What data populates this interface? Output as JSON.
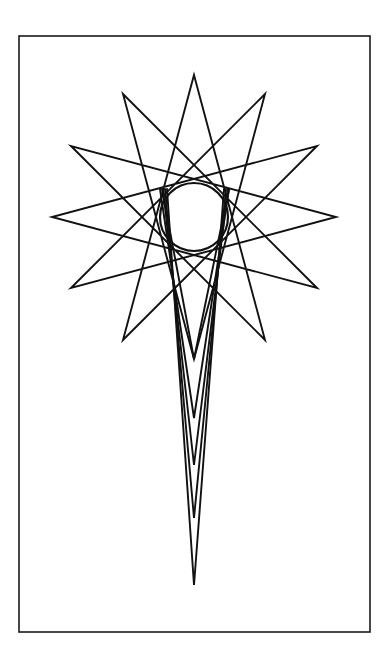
{
  "page": {
    "background_color": "#ffffff",
    "width": 388,
    "height": 663
  },
  "frame": {
    "name": "rectangular-border",
    "x": 19,
    "y": 36,
    "width": 351,
    "height": 596,
    "stroke_color": "#1a1a1a",
    "stroke_width": 1.6,
    "fill": "none"
  },
  "figure": {
    "name": "star-comet-figure",
    "stroke_color": "#111111",
    "stroke_width": 1.9,
    "fill": "none",
    "center_x": 194,
    "center_y": 217
  },
  "star": {
    "name": "twelve-point-star-polygon",
    "points": 12,
    "step": 5,
    "outer_radius": 142,
    "start_angle_deg": -90,
    "vertices": [
      {
        "index": 0,
        "x": 194,
        "y": 75
      },
      {
        "index": 1,
        "x": 265,
        "y": 94
      },
      {
        "index": 2,
        "x": 317,
        "y": 146
      },
      {
        "index": 3,
        "x": 336,
        "y": 217
      },
      {
        "index": 4,
        "x": 317,
        "y": 288
      },
      {
        "index": 5,
        "x": 265,
        "y": 340
      },
      {
        "index": 6,
        "x": 194,
        "y": 359
      },
      {
        "index": 7,
        "x": 123,
        "y": 340
      },
      {
        "index": 8,
        "x": 71,
        "y": 288
      },
      {
        "index": 9,
        "x": 52,
        "y": 217
      },
      {
        "index": 10,
        "x": 71,
        "y": 146
      },
      {
        "index": 11,
        "x": 123,
        "y": 94
      }
    ]
  },
  "inner_circle": {
    "name": "central-envelope-circle",
    "center_x": 194,
    "center_y": 217,
    "radius": 34,
    "stroke_color": "#111111",
    "stroke_width": 2.2,
    "fill": "none"
  },
  "tail": {
    "name": "comet-tail-lines",
    "apex_x": 194,
    "tip_count": 5,
    "tips": [
      {
        "index": 0,
        "x": 194,
        "y": 359,
        "left_x": 162,
        "right_x": 229
      },
      {
        "index": 1,
        "x": 194,
        "y": 418,
        "left_x": 160,
        "right_x": 229
      },
      {
        "index": 2,
        "x": 194,
        "y": 465,
        "left_x": 163,
        "right_x": 228
      },
      {
        "index": 3,
        "x": 194,
        "y": 518,
        "left_x": 165,
        "right_x": 226
      },
      {
        "index": 4,
        "x": 194,
        "y": 585,
        "left_x": 167,
        "right_x": 224
      }
    ]
  },
  "chart_data": {
    "type": "scatter",
    "xlabel": "",
    "ylabel": "",
    "xlim": [
      19,
      370
    ],
    "ylim": [
      36,
      632
    ],
    "grid": false,
    "legend": "none",
    "series": [
      {
        "name": "star-vertices",
        "x": [
          194,
          265,
          317,
          336,
          317,
          265,
          194,
          123,
          71,
          52,
          71,
          123
        ],
        "y": [
          75,
          94,
          146,
          217,
          288,
          340,
          359,
          340,
          288,
          217,
          146,
          94
        ]
      },
      {
        "name": "tail-tips",
        "x": [
          194,
          194,
          194,
          194,
          194
        ],
        "y": [
          359,
          418,
          465,
          518,
          585
        ]
      }
    ],
    "annotations": [
      {
        "label": "central circle",
        "x": 194,
        "y": 217,
        "radius": 34
      }
    ]
  }
}
